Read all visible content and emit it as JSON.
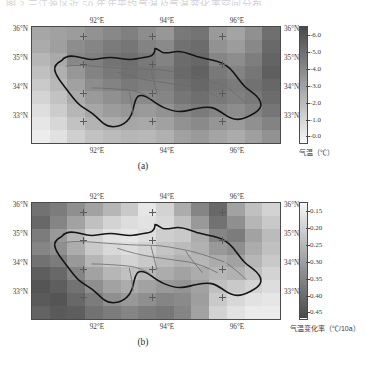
{
  "page": {
    "cut_text": "图 2  三江源区近 50 年年平均气温及气温变化率空间分布"
  },
  "panels": [
    {
      "id": "panel-a",
      "caption": "(a)",
      "axes": {
        "lat_ticks": [
          "36°N",
          "35°N",
          "34°N",
          "33°N"
        ],
        "lon_ticks": [
          "92°E",
          "94°E",
          "96°E"
        ],
        "lon_position": "top-and-bottom",
        "lat_position": "left-and-right"
      },
      "colorbar": {
        "title": "气温（℃）",
        "labels": [
          "-6.0",
          "-5.0",
          "-4.0",
          "-3.0",
          "-2.0",
          "-1.0",
          "-0.0"
        ],
        "orientation": "vertical",
        "high_end": "top",
        "ramp_top_color": "#f2f2f2",
        "ramp_bottom_color": "#555555"
      }
    },
    {
      "id": "panel-b",
      "caption": "(b)",
      "axes": {
        "lat_ticks": [
          "36°N",
          "35°N",
          "34°N",
          "33°N"
        ],
        "lon_ticks": [
          "92°E",
          "94°E",
          "96°E"
        ],
        "lon_position": "top-and-bottom",
        "lat_position": "left-and-right"
      },
      "colorbar": {
        "title": "气温变化率（℃/10a）",
        "labels": [
          "0.15",
          "0.20",
          "0.25",
          "0.30",
          "0.35",
          "0.40",
          "0.45"
        ],
        "orientation": "vertical",
        "high_end": "bottom",
        "ramp_top_color": "#f0f0f0",
        "ramp_bottom_color": "#4a4a4a"
      }
    }
  ],
  "chart_data": {
    "type": "heatmap",
    "xlabel": "经度",
    "ylabel": "纬度",
    "xlim": [
      90.6,
      97.4
    ],
    "ylim": [
      32.3,
      36.4
    ],
    "grid": false,
    "legend": "colorbar-right",
    "maps": [
      {
        "name": "panel-a",
        "variable": "气温",
        "units": "℃",
        "vmin": -6.5,
        "vmax": 0.2,
        "cbar_ticks": [
          -6.0,
          -5.0,
          -4.0,
          -3.0,
          -2.0,
          -1.0,
          -0.0
        ],
        "cmap": "gray-reversed",
        "nx": 14,
        "ny": 9,
        "x_centers": [
          90.84,
          91.32,
          91.8,
          92.29,
          92.77,
          93.26,
          93.74,
          94.23,
          94.71,
          95.2,
          95.68,
          96.17,
          96.65,
          97.14
        ],
        "y_centers": [
          36.17,
          35.71,
          35.26,
          34.8,
          34.35,
          33.89,
          33.44,
          32.98,
          32.53
        ],
        "values": [
          [
            -3.4,
            -3.2,
            -3.0,
            -2.6,
            -2.2,
            -1.9,
            -2.4,
            -2.8,
            -1.6,
            -1.4,
            -2.9,
            -3.3,
            -2.5,
            -1.2
          ],
          [
            -3.6,
            -3.1,
            -2.4,
            -2.1,
            -1.7,
            -1.5,
            -2.0,
            -2.3,
            -1.3,
            -1.1,
            -2.6,
            -3.0,
            -2.2,
            -1.0
          ],
          [
            -4.0,
            -3.5,
            -2.2,
            -1.9,
            -1.4,
            -1.2,
            -1.6,
            -2.0,
            -1.1,
            -0.9,
            -2.1,
            -2.4,
            -1.8,
            -0.8
          ],
          [
            -4.4,
            -3.8,
            -2.8,
            -2.0,
            -1.6,
            -1.3,
            -1.5,
            -1.7,
            -1.0,
            -0.7,
            -1.6,
            -2.0,
            -1.5,
            -0.6
          ],
          [
            -4.8,
            -4.1,
            -3.2,
            -2.4,
            -2.0,
            -1.6,
            -1.8,
            -1.9,
            -1.2,
            -0.9,
            -1.4,
            -1.7,
            -1.3,
            -0.9
          ],
          [
            -5.2,
            -4.5,
            -3.6,
            -2.9,
            -2.5,
            -2.2,
            -2.3,
            -2.1,
            -1.5,
            -1.2,
            -1.6,
            -1.9,
            -1.6,
            -1.1
          ],
          [
            -5.6,
            -4.9,
            -4.0,
            -3.4,
            -3.0,
            -2.8,
            -2.9,
            -2.6,
            -2.0,
            -1.7,
            -2.1,
            -2.4,
            -2.0,
            -1.5
          ],
          [
            -5.9,
            -5.3,
            -4.5,
            -3.9,
            -3.6,
            -3.4,
            -3.5,
            -3.2,
            -2.6,
            -2.3,
            -2.7,
            -3.0,
            -2.5,
            -2.0
          ],
          [
            -6.2,
            -5.7,
            -5.0,
            -4.5,
            -4.2,
            -4.0,
            -4.1,
            -3.8,
            -3.2,
            -2.9,
            -3.3,
            -3.6,
            -3.1,
            -2.6
          ]
        ]
      },
      {
        "name": "panel-b",
        "variable": "气温变化率",
        "units": "℃/10a",
        "vmin": 0.13,
        "vmax": 0.48,
        "cbar_ticks": [
          0.15,
          0.2,
          0.25,
          0.3,
          0.35,
          0.4,
          0.45
        ],
        "cmap": "gray-reversed",
        "nx": 14,
        "ny": 9,
        "x_centers": [
          90.84,
          91.32,
          91.8,
          92.29,
          92.77,
          93.26,
          93.74,
          94.23,
          94.71,
          95.2,
          95.68,
          96.17,
          96.65,
          97.14
        ],
        "y_centers": [
          36.17,
          35.71,
          35.26,
          34.8,
          34.35,
          33.89,
          33.44,
          32.98,
          32.53
        ],
        "values": [
          [
            0.4,
            0.38,
            0.34,
            0.3,
            0.26,
            0.22,
            0.16,
            0.2,
            0.28,
            0.36,
            0.42,
            0.3,
            0.24,
            0.2
          ],
          [
            0.42,
            0.36,
            0.3,
            0.24,
            0.2,
            0.18,
            0.17,
            0.19,
            0.24,
            0.32,
            0.4,
            0.34,
            0.26,
            0.22
          ],
          [
            0.38,
            0.32,
            0.26,
            0.2,
            0.17,
            0.16,
            0.18,
            0.21,
            0.22,
            0.28,
            0.36,
            0.38,
            0.3,
            0.25
          ],
          [
            0.36,
            0.34,
            0.28,
            0.22,
            0.19,
            0.18,
            0.2,
            0.23,
            0.25,
            0.27,
            0.32,
            0.34,
            0.28,
            0.24
          ],
          [
            0.4,
            0.38,
            0.32,
            0.26,
            0.22,
            0.2,
            0.22,
            0.25,
            0.27,
            0.26,
            0.28,
            0.3,
            0.26,
            0.22
          ],
          [
            0.44,
            0.42,
            0.36,
            0.3,
            0.26,
            0.24,
            0.26,
            0.28,
            0.3,
            0.28,
            0.26,
            0.27,
            0.24,
            0.2
          ],
          [
            0.46,
            0.44,
            0.4,
            0.34,
            0.3,
            0.28,
            0.3,
            0.32,
            0.33,
            0.3,
            0.24,
            0.22,
            0.2,
            0.18
          ],
          [
            0.45,
            0.46,
            0.42,
            0.38,
            0.34,
            0.32,
            0.34,
            0.36,
            0.35,
            0.31,
            0.22,
            0.19,
            0.17,
            0.16
          ],
          [
            0.43,
            0.45,
            0.44,
            0.4,
            0.38,
            0.36,
            0.38,
            0.39,
            0.36,
            0.3,
            0.2,
            0.17,
            0.15,
            0.15
          ]
        ]
      }
    ]
  }
}
